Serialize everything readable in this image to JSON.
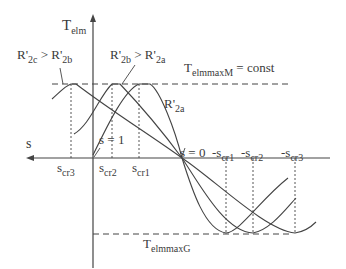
{
  "diagram": {
    "axes": {
      "y_label": {
        "main": "T",
        "sub": "elm"
      },
      "x_label": "s"
    },
    "labels": {
      "r2c_gt_r2b": {
        "a": "R'",
        "a_sub": "2c",
        "op": " > ",
        "b": "R'",
        "b_sub": "2b"
      },
      "r2b_gt_r2a": {
        "a": "R'",
        "a_sub": "2b",
        "op": " > ",
        "b": "R'",
        "b_sub": "2a"
      },
      "r2a": {
        "a": "R'",
        "a_sub": "2a"
      },
      "tmax_motor": {
        "main": "T",
        "sub": "elmmaxM",
        "rest": " = const"
      },
      "tmax_gen": {
        "main": "T",
        "sub": "elmmaxG"
      },
      "s_eq_1": "s = 1",
      "s_eq_0": "s = 0",
      "scr3": {
        "main": "s",
        "sub": "cr3"
      },
      "scr2": {
        "main": "s",
        "sub": "cr2"
      },
      "scr1": {
        "main": "s",
        "sub": "cr1"
      },
      "neg_scr1": {
        "main": "-s",
        "sub": "cr1"
      },
      "neg_scr2": {
        "main": "-s",
        "sub": "cr2"
      },
      "neg_scr3": {
        "main": "-s",
        "sub": "cr3"
      }
    }
  }
}
